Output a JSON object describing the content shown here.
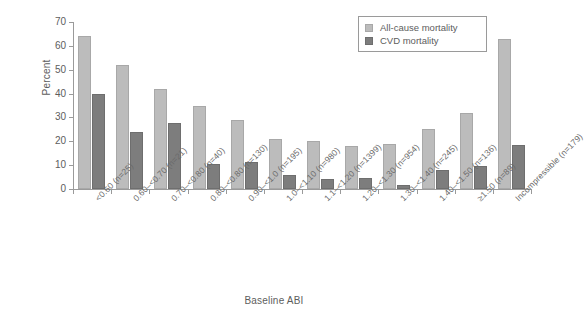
{
  "chart_data": {
    "type": "bar",
    "title": "",
    "xlabel": "Baseline ABI",
    "ylabel": "Percent",
    "ylim": [
      0,
      70
    ],
    "yticks": [
      0,
      10,
      20,
      30,
      40,
      50,
      60,
      70
    ],
    "grid": false,
    "legend_position": "top-right",
    "categories": [
      "<0.60 (n=25)",
      "0.60–<0.70 (n=21)",
      "0.70–<0.80 (n=40)",
      "0.80–<0.80 (n=130)",
      "0.90–<1.0 (n=195)",
      "1.0–<1.10 (n=980)",
      "1.1–<1.20 (n=1399)",
      "1.20–<1.30 (n=954)",
      "1.30–<1.40 (n=245)",
      "1.40–<1.50 (n=136)",
      "≥1.50 (n=89)",
      "Incompressible (n=179)"
    ],
    "series": [
      {
        "name": "All-cause mortality",
        "color": "#bcbcbc",
        "values": [
          64,
          52,
          42,
          35,
          29,
          21,
          20,
          18,
          19,
          25,
          32,
          63
        ]
      },
      {
        "name": "CVD mortality",
        "color": "#7d7d7d",
        "values": [
          40,
          24,
          27.5,
          10.5,
          11.5,
          6,
          4,
          4.5,
          1.5,
          8,
          9.5,
          18.5
        ]
      }
    ]
  },
  "legend": {
    "items": [
      {
        "label": "All-cause mortality",
        "swatch": "series-0"
      },
      {
        "label": "CVD mortality",
        "swatch": "series-1"
      }
    ]
  }
}
